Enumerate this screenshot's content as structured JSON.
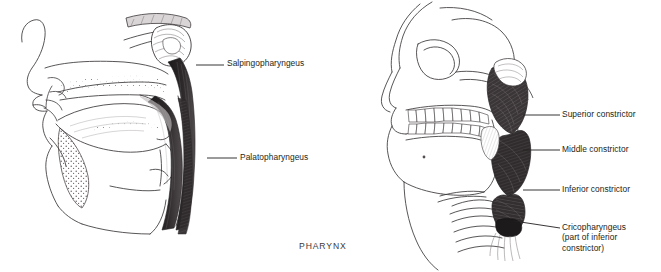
{
  "figure": {
    "caption": "PHARYNX",
    "left_panel": {
      "name": "midsagittal-section-of-head-and-pharynx",
      "labels": [
        {
          "id": "salpingopharyngeus",
          "text": "Salpingopharyngeus",
          "text_x": 227,
          "text_y": 58,
          "leader": {
            "x1": 196,
            "y1": 65,
            "x2": 224,
            "y2": 65
          }
        },
        {
          "id": "palatopharyngeus",
          "text": "Palatopharyngeus",
          "text_x": 240,
          "text_y": 152,
          "leader": {
            "x1": 207,
            "y1": 158,
            "x2": 237,
            "y2": 158
          }
        }
      ]
    },
    "right_panel": {
      "name": "lateral-view-of-skull-and-pharyngeal-constrictors",
      "labels": [
        {
          "id": "superior-constrictor",
          "lines": [
            "Superior constrictor"
          ],
          "text_x": 562,
          "text_y": 109,
          "leader": {
            "x1": 523,
            "y1": 115,
            "x2": 560,
            "y2": 115
          }
        },
        {
          "id": "middle-constrictor",
          "lines": [
            "Middle constrictor"
          ],
          "text_x": 562,
          "text_y": 144,
          "leader": {
            "x1": 523,
            "y1": 150,
            "x2": 560,
            "y2": 150
          }
        },
        {
          "id": "inferior-constrictor",
          "lines": [
            "Inferior constrictor"
          ],
          "text_x": 562,
          "text_y": 184,
          "leader": {
            "x1": 523,
            "y1": 190,
            "x2": 560,
            "y2": 190
          }
        },
        {
          "id": "cricopharyngeus",
          "lines": [
            "Cricopharyngeus",
            "(part of inferior",
            "constrictor)"
          ],
          "text_x": 562,
          "text_y": 222,
          "leader": {
            "x1": 514,
            "y1": 221,
            "x2": 560,
            "y2": 228
          }
        }
      ]
    },
    "colors": {
      "ink": "#231f20",
      "muscle_dark": "#2f2b2c",
      "muscle_mid": "#4a4547",
      "outline": "#3b3739",
      "background": "#ffffff",
      "caption": "#3a3a3a"
    }
  }
}
